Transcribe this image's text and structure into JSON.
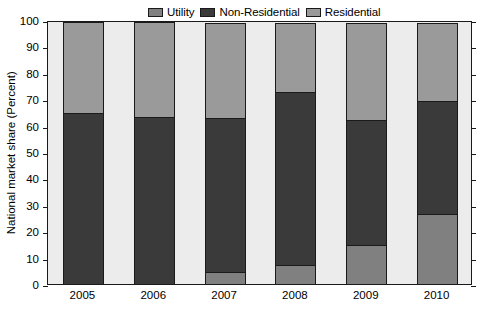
{
  "chart_data": {
    "type": "bar",
    "title": "",
    "xlabel": "",
    "ylabel": "National market share (Percent)",
    "categories": [
      "2005",
      "2006",
      "2007",
      "2008",
      "2009",
      "2010"
    ],
    "ylim": [
      0,
      100
    ],
    "yticks": [
      0,
      10,
      20,
      30,
      40,
      50,
      60,
      70,
      80,
      90,
      100
    ],
    "grid": false,
    "stacked": true,
    "legend_position": "top-center",
    "series": [
      {
        "name": "Utility",
        "color": "#808080",
        "values": [
          0,
          0,
          5,
          7.5,
          15,
          27
        ]
      },
      {
        "name": "Non-Residential",
        "color": "#3a3a3a",
        "values": [
          65,
          63.5,
          58.5,
          66,
          48,
          43
        ]
      },
      {
        "name": "Residential",
        "color": "#9a9a9a",
        "values": [
          35,
          36.5,
          36.5,
          26.5,
          37,
          30
        ]
      }
    ],
    "cumulative_tops": {
      "2005": [
        0,
        65,
        100
      ],
      "2006": [
        0,
        63.5,
        100
      ],
      "2007": [
        5,
        63.5,
        100
      ],
      "2008": [
        7.5,
        73.5,
        100
      ],
      "2009": [
        15,
        63,
        100
      ],
      "2010": [
        27,
        70,
        100
      ]
    },
    "plot_background": "#ececec",
    "axis_color": "#1a1a1a"
  }
}
